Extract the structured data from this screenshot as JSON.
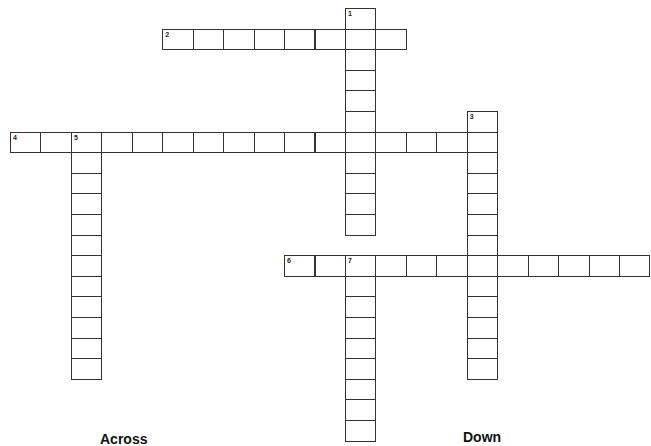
{
  "puzzle": {
    "words": [
      {
        "number": "1",
        "direction": "down",
        "row": 0,
        "col": 11,
        "length": 11
      },
      {
        "number": "2",
        "direction": "across",
        "row": 1,
        "col": 5,
        "length": 8
      },
      {
        "number": "3",
        "direction": "down",
        "row": 5,
        "col": 15,
        "length": 13
      },
      {
        "number": "4",
        "direction": "across",
        "row": 6,
        "col": 0,
        "length": 16
      },
      {
        "number": "5",
        "direction": "down",
        "row": 6,
        "col": 2,
        "length": 12
      },
      {
        "number": "6",
        "direction": "across",
        "row": 12,
        "col": 9,
        "length": 12
      },
      {
        "number": "7",
        "direction": "down",
        "row": 12,
        "col": 11,
        "length": 9
      }
    ]
  },
  "clues": {
    "across_heading": "Across",
    "down_heading": "Down"
  }
}
